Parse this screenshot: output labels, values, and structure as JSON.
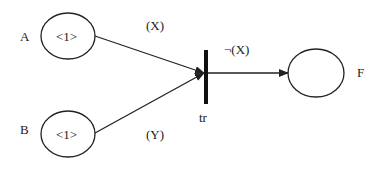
{
  "diagram": {
    "type": "petri-net",
    "places": [
      {
        "id": "A",
        "label": "A",
        "tokens": "<1>"
      },
      {
        "id": "B",
        "label": "B",
        "tokens": "<1>"
      },
      {
        "id": "F",
        "label": "F",
        "tokens": ""
      }
    ],
    "transition": {
      "id": "tr",
      "label": "tr"
    },
    "arcs": [
      {
        "from": "A",
        "to": "tr",
        "label": "(X)"
      },
      {
        "from": "B",
        "to": "tr",
        "label": "(Y)"
      },
      {
        "from": "tr",
        "to": "F",
        "label": "¬(X)"
      }
    ]
  }
}
